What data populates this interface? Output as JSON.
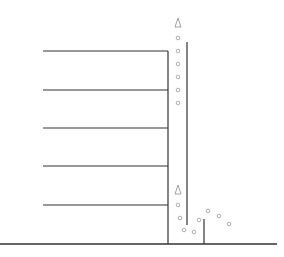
{
  "diagram": {
    "type": "building-with-riser-and-bubbles",
    "colors": {
      "line": "#333333",
      "bubble": "#999999",
      "background": "#ffffff"
    },
    "ground": {
      "x1": 0,
      "x2": 277,
      "y": 244
    },
    "building_wall": {
      "x": 168,
      "y1": 51,
      "y2": 244
    },
    "floors": [
      {
        "x1": 43,
        "x2": 168,
        "y": 51
      },
      {
        "x1": 43,
        "x2": 168,
        "y": 90
      },
      {
        "x1": 43,
        "x2": 168,
        "y": 128
      },
      {
        "x1": 43,
        "x2": 168,
        "y": 166
      },
      {
        "x1": 43,
        "x2": 168,
        "y": 205
      }
    ],
    "riser": {
      "x": 187,
      "y1": 42,
      "y2": 225
    },
    "post": {
      "x": 204,
      "y1": 219,
      "y2": 244
    },
    "markers": [
      {
        "shape": "triangle",
        "x": 178,
        "y": 23
      },
      {
        "shape": "triangle",
        "x": 178,
        "y": 190
      }
    ],
    "bubbles": [
      {
        "x": 178,
        "y": 38
      },
      {
        "x": 178,
        "y": 51
      },
      {
        "x": 178,
        "y": 64
      },
      {
        "x": 178,
        "y": 77
      },
      {
        "x": 178,
        "y": 90
      },
      {
        "x": 178,
        "y": 103
      },
      {
        "x": 178,
        "y": 205
      },
      {
        "x": 180,
        "y": 218
      },
      {
        "x": 184,
        "y": 230
      },
      {
        "x": 194,
        "y": 232
      },
      {
        "x": 199,
        "y": 220
      },
      {
        "x": 208,
        "y": 211
      },
      {
        "x": 219,
        "y": 216
      },
      {
        "x": 229,
        "y": 224
      }
    ]
  }
}
